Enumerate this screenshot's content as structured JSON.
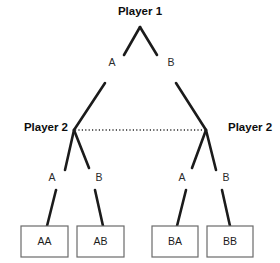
{
  "diagram": {
    "type": "extensive-form-game-tree",
    "title_label": "Player 1",
    "colors": {
      "edge": "#1b1b1b",
      "box_stroke": "#6a6a6a",
      "background": "#ffffff",
      "text": "#1b1b1b",
      "info_set": "#2a2a2a"
    },
    "player_labels": [
      {
        "id": "player1-root",
        "text": "Player 1",
        "x": 140,
        "y": 12,
        "anchor": "middle"
      },
      {
        "id": "player2-left",
        "text": "Player 2",
        "x": 68,
        "y": 128,
        "anchor": "end"
      },
      {
        "id": "player2-right",
        "text": "Player 2",
        "x": 228,
        "y": 128,
        "anchor": "start"
      }
    ],
    "action_labels": [
      {
        "id": "root-action-a",
        "text": "A",
        "x": 112,
        "y": 63
      },
      {
        "id": "root-action-b",
        "text": "B",
        "x": 171,
        "y": 63
      },
      {
        "id": "left-action-a",
        "text": "A",
        "x": 52,
        "y": 178
      },
      {
        "id": "left-action-b",
        "text": "B",
        "x": 99,
        "y": 178
      },
      {
        "id": "right-action-a",
        "text": "A",
        "x": 182,
        "y": 178
      },
      {
        "id": "right-action-b",
        "text": "B",
        "x": 226,
        "y": 178
      }
    ],
    "edges": [
      {
        "id": "root-to-a-upper",
        "x1": 140,
        "y1": 27,
        "x2": 124,
        "y2": 55
      },
      {
        "id": "root-to-b-upper",
        "x1": 140,
        "y1": 27,
        "x2": 157,
        "y2": 55
      },
      {
        "id": "a-to-player2-left",
        "x1": 105,
        "y1": 83,
        "x2": 74,
        "y2": 130
      },
      {
        "id": "b-to-player2-right",
        "x1": 176,
        "y1": 83,
        "x2": 206,
        "y2": 130
      },
      {
        "id": "left-node-to-a",
        "x1": 74,
        "y1": 130,
        "x2": 65,
        "y2": 170
      },
      {
        "id": "left-node-to-b",
        "x1": 74,
        "y1": 130,
        "x2": 89,
        "y2": 168
      },
      {
        "id": "right-node-to-a",
        "x1": 206,
        "y1": 130,
        "x2": 192,
        "y2": 168
      },
      {
        "id": "right-node-to-b",
        "x1": 206,
        "y1": 130,
        "x2": 216,
        "y2": 170
      },
      {
        "id": "a-stem-to-aa",
        "x1": 56,
        "y1": 190,
        "x2": 47,
        "y2": 226
      },
      {
        "id": "b-stem-to-ab",
        "x1": 95,
        "y1": 190,
        "x2": 103,
        "y2": 226
      },
      {
        "id": "a-stem-to-ba",
        "x1": 186,
        "y1": 190,
        "x2": 177,
        "y2": 226
      },
      {
        "id": "b-stem-to-bb",
        "x1": 222,
        "y1": 190,
        "x2": 230,
        "y2": 226
      }
    ],
    "info_set": {
      "id": "player2-information-set",
      "x1": 75,
      "y1": 130,
      "x2": 205,
      "y2": 130
    },
    "outcomes": [
      {
        "id": "outcome-aa",
        "label": "AA",
        "x": 21,
        "y": 226,
        "width": 47,
        "height": 31
      },
      {
        "id": "outcome-ab",
        "label": "AB",
        "x": 77,
        "y": 226,
        "width": 47,
        "height": 31
      },
      {
        "id": "outcome-ba",
        "label": "BA",
        "x": 152,
        "y": 226,
        "width": 46,
        "height": 31
      },
      {
        "id": "outcome-bb",
        "label": "BB",
        "x": 207,
        "y": 226,
        "width": 46,
        "height": 31
      }
    ]
  }
}
